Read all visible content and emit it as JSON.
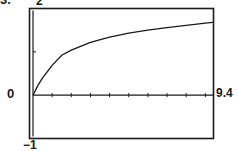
{
  "problem_number": "3.",
  "window": {
    "xmin_label": "0",
    "xmax_label": "9.4",
    "ymin_label": "−1",
    "ymax_label": "2"
  },
  "chart_data": {
    "type": "line",
    "title": "",
    "xlabel": "",
    "ylabel": "",
    "xlim": [
      0,
      9.4
    ],
    "ylim": [
      -1,
      2
    ],
    "xticks": [
      1,
      2,
      3,
      4,
      5,
      6,
      7,
      8,
      9
    ],
    "yticks": [
      1
    ],
    "grid": false,
    "legend": null,
    "series": [
      {
        "name": "curve",
        "x": [
          0,
          0.25,
          0.5,
          1,
          1.5,
          2,
          3,
          4,
          5,
          6,
          7,
          8,
          9,
          9.4
        ],
        "y": [
          0,
          0.22,
          0.4,
          0.69,
          0.92,
          1.04,
          1.22,
          1.34,
          1.43,
          1.5,
          1.56,
          1.61,
          1.66,
          1.68
        ]
      }
    ],
    "annotations": [
      "0",
      "9.4",
      "-1",
      "2"
    ]
  }
}
